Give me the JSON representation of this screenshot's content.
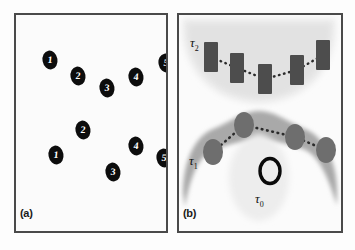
{
  "figure": {
    "background_color": "#fdfdfd",
    "panels": [
      {
        "id": "a",
        "label": "(a)",
        "description": "scatter of numbered oval tokens"
      },
      {
        "id": "b",
        "label": "(b)",
        "description": "three nested shaded trajectory bands tau0 tau1 tau2"
      }
    ]
  },
  "panel_a": {
    "label": "(a)",
    "token_fill": "#0d0d0d",
    "token_text_color": "#ffffff",
    "tokens": [
      {
        "name": "token-top-1",
        "text": "1",
        "x": 34,
        "y": 45
      },
      {
        "name": "token-top-2",
        "text": "2",
        "x": 62,
        "y": 61
      },
      {
        "name": "token-top-3",
        "text": "3",
        "x": 91,
        "y": 73
      },
      {
        "name": "token-top-4",
        "text": "4",
        "x": 120,
        "y": 62
      },
      {
        "name": "token-top-5",
        "text": "5",
        "x": 150,
        "y": 48
      },
      {
        "name": "token-bot-2",
        "text": "2",
        "x": 67,
        "y": 115
      },
      {
        "name": "token-bot-1",
        "text": "1",
        "x": 40,
        "y": 140
      },
      {
        "name": "token-bot-4",
        "text": "4",
        "x": 120,
        "y": 131
      },
      {
        "name": "token-bot-5",
        "text": "5",
        "x": 148,
        "y": 143
      },
      {
        "name": "token-bot-3",
        "text": "3",
        "x": 97,
        "y": 157
      }
    ]
  },
  "panel_b": {
    "label": "(b)",
    "labels": {
      "tau2_base": "τ",
      "tau2_sub": "2",
      "tau1_base": "τ",
      "tau1_sub": "1",
      "tau0_base": "τ",
      "tau0_sub": "0"
    },
    "colors": {
      "tau2_band": "#e7e7e7",
      "tau1_band": "#a9a9a9",
      "tau0_band": "#ededed",
      "marker_rect": "#4a4a4a",
      "marker_ellipse": "#6e6e6e",
      "dotted_link": "#2b2b2b",
      "tau0_ring": "#0a0a0a"
    },
    "tau2_markers": [
      {
        "name": "tau2-marker-1",
        "x": 32,
        "y": 42
      },
      {
        "name": "tau2-marker-2",
        "x": 58,
        "y": 53
      },
      {
        "name": "tau2-marker-3",
        "x": 86,
        "y": 64
      },
      {
        "name": "tau2-marker-4",
        "x": 118,
        "y": 55
      },
      {
        "name": "tau2-marker-5",
        "x": 144,
        "y": 40
      }
    ],
    "tau1_markers": [
      {
        "name": "tau1-marker-1",
        "x": 34,
        "y": 137
      },
      {
        "name": "tau1-marker-2",
        "x": 65,
        "y": 110
      },
      {
        "name": "tau1-marker-3",
        "x": 116,
        "y": 122
      },
      {
        "name": "tau1-marker-4",
        "x": 147,
        "y": 135
      }
    ],
    "tau0_ring": {
      "name": "tau0-ring",
      "x": 91,
      "y": 156,
      "rx": 11,
      "ry": 13
    }
  }
}
